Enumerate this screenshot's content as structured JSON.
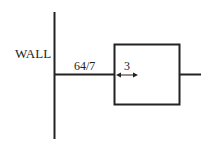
{
  "diagram": {
    "wall_label": "WALL",
    "rod_length_label": "64/7",
    "gap_label": "3",
    "colors": {
      "stroke": "#222222",
      "background": "#ffffff"
    }
  }
}
